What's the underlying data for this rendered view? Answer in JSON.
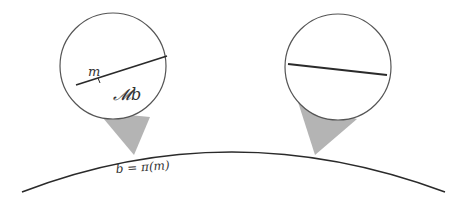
{
  "diagram": {
    "labels": {
      "point": "m",
      "fiber": "𝓜b",
      "base_point": "b = π(m)"
    },
    "colors": {
      "stroke": "#2a2a2a",
      "circle_stroke": "#555555",
      "cone_fill": "#b4b4b4"
    },
    "elements": [
      {
        "type": "base-curve",
        "description": "arc representing base space"
      },
      {
        "type": "fiber-circle-left",
        "contains": [
          "m",
          "𝓜b",
          "fiber line"
        ]
      },
      {
        "type": "fiber-circle-right",
        "contains": [
          "fiber line"
        ]
      },
      {
        "type": "cone-left",
        "attaches_to": "b = π(m)"
      },
      {
        "type": "cone-right"
      }
    ]
  }
}
